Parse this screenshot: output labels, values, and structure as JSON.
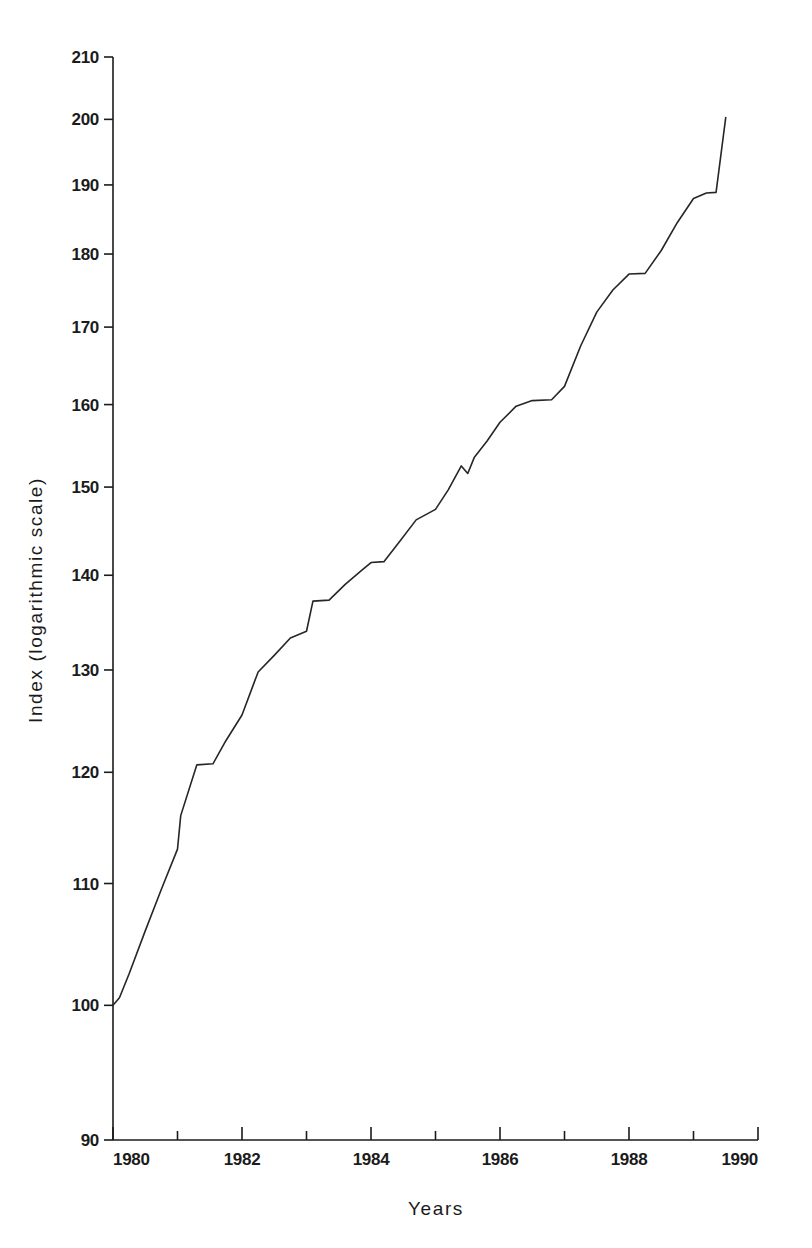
{
  "chart_data": {
    "type": "line",
    "title": "",
    "subtitle": "",
    "xlabel": "Years",
    "ylabel": "Index (logarithmic scale)",
    "y_scale": "log",
    "x_scale": "linear",
    "xlim": [
      1980,
      1990
    ],
    "ylim": [
      90,
      210
    ],
    "grid": false,
    "legend": null,
    "y_ticks": [
      90,
      100,
      110,
      120,
      130,
      140,
      150,
      160,
      170,
      180,
      190,
      200,
      210
    ],
    "y_tick_labels": [
      "90",
      "100",
      "110",
      "120",
      "130",
      "140",
      "150",
      "160",
      "170",
      "180",
      "190",
      "200",
      "210"
    ],
    "x_ticks": [
      1980,
      1981,
      1982,
      1983,
      1984,
      1985,
      1986,
      1987,
      1988,
      1989,
      1990
    ],
    "x_tick_labels_major": [
      "1980",
      "1982",
      "1984",
      "1986",
      "1988",
      "1990"
    ],
    "x_major_ticks": [
      1980,
      1982,
      1984,
      1986,
      1988,
      1990
    ],
    "line_color": "#262626",
    "line_width": 1.6,
    "background": "#ffffff",
    "series": [
      {
        "name": "Index",
        "x": [
          1980.0,
          1980.1,
          1980.25,
          1980.5,
          1980.75,
          1981.0,
          1981.05,
          1981.3,
          1981.55,
          1981.75,
          1982.0,
          1982.25,
          1982.5,
          1982.75,
          1983.0,
          1983.1,
          1983.35,
          1983.6,
          1983.85,
          1984.0,
          1984.2,
          1984.45,
          1984.7,
          1985.0,
          1985.2,
          1985.4,
          1985.5,
          1985.6,
          1985.8,
          1986.0,
          1986.25,
          1986.5,
          1986.8,
          1987.0,
          1987.25,
          1987.5,
          1987.75,
          1988.0,
          1988.25,
          1988.5,
          1988.75,
          1989.0,
          1989.2,
          1989.35,
          1989.5
        ],
        "y": [
          100.0,
          100.6,
          102.5,
          106.0,
          109.5,
          113.0,
          116.0,
          120.7,
          120.8,
          123.0,
          125.5,
          129.8,
          131.5,
          133.3,
          134.0,
          137.2,
          137.3,
          139.0,
          140.5,
          141.4,
          141.5,
          143.8,
          146.2,
          147.4,
          149.7,
          152.5,
          151.6,
          153.5,
          155.5,
          157.8,
          159.8,
          160.5,
          160.6,
          162.3,
          167.5,
          172.0,
          175.0,
          177.2,
          177.3,
          180.5,
          184.5,
          188.0,
          188.8,
          188.9,
          200.3
        ]
      }
    ],
    "annotations": [
      {
        "text": "plateau near 1981 at index 120.7"
      },
      {
        "text": "plateau near 1983 at index 137.2"
      },
      {
        "text": "dip mid-1985 from 152.5 to 151.6"
      },
      {
        "text": "plateau near 1986.5 at index 160.5"
      },
      {
        "text": "plateau near 1988 at index 177.2"
      },
      {
        "text": "plateau near 1989.2 at index 188.8"
      }
    ]
  },
  "layout": {
    "plot_left": 113,
    "plot_right": 758,
    "plot_top": 57,
    "plot_bottom": 1140
  }
}
